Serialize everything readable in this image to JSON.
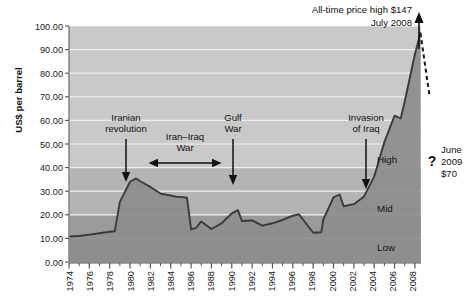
{
  "chart_data": {
    "type": "area",
    "title": "",
    "subtitle": "",
    "xlabel": "",
    "ylabel": "US$ per barrel",
    "xlim": [
      1974,
      2008.6
    ],
    "ylim": [
      0,
      100
    ],
    "grid": true,
    "legend_position": "none",
    "y_ticks": [
      "0.00",
      "10.00",
      "20.00",
      "30.00",
      "40.00",
      "50.00",
      "60.00",
      "70.00",
      "80.00",
      "90.00",
      "100.00"
    ],
    "y_tick_values": [
      0,
      10,
      20,
      30,
      40,
      50,
      60,
      70,
      80,
      90,
      100
    ],
    "x_ticks": [
      "1974",
      "1976",
      "1978",
      "1980",
      "1982",
      "1984",
      "1986",
      "1988",
      "1990",
      "1992",
      "1994",
      "1996",
      "1998",
      "2000",
      "2002",
      "2004",
      "2006",
      "2008"
    ],
    "x_tick_values": [
      1974,
      1976,
      1978,
      1980,
      1982,
      1984,
      1986,
      1988,
      1990,
      1992,
      1994,
      1996,
      1998,
      2000,
      2002,
      2004,
      2006,
      2008
    ],
    "x_minor_ticks": [
      1975,
      1977,
      1979,
      1981,
      1983,
      1985,
      1987,
      1989,
      1991,
      1993,
      1995,
      1997,
      1999,
      2001,
      2003,
      2005,
      2007
    ],
    "series": [
      {
        "name": "Crude oil price",
        "x": [
          1974,
          1975,
          1976,
          1977,
          1978,
          1978.5,
          1979,
          1980,
          1980.6,
          1981,
          1982,
          1983,
          1984,
          1984.6,
          1985,
          1985.6,
          1986,
          1986.5,
          1987,
          1987.5,
          1988,
          1989,
          1990,
          1990.6,
          1991,
          1992,
          1993,
          1994,
          1995,
          1996,
          1996.6,
          1997,
          1998,
          1998.8,
          1999,
          2000,
          2000.6,
          2001,
          2002,
          2003,
          2004,
          2005,
          2006,
          2006.6,
          2007,
          2008,
          2008.55
        ],
        "y": [
          10.8,
          11.0,
          11.6,
          12.2,
          12.8,
          13.0,
          25.5,
          34.0,
          35.4,
          34.2,
          31.8,
          29.0,
          28.2,
          27.6,
          27.6,
          27.2,
          13.8,
          14.5,
          17.2,
          15.6,
          14.0,
          16.4,
          20.6,
          22.0,
          17.4,
          17.6,
          15.4,
          16.4,
          17.8,
          19.6,
          20.2,
          18.0,
          12.4,
          12.6,
          18.0,
          27.4,
          28.6,
          23.6,
          24.5,
          27.8,
          36.2,
          50.8,
          62.0,
          60.8,
          68.0,
          88.0,
          97.0
        ],
        "color": "#3a3a3a",
        "fill": true
      },
      {
        "name": "Projected decline",
        "style": "dashed",
        "x": [
          2008.55,
          2009.45
        ],
        "y": [
          97.0,
          70.0
        ],
        "color": "#1f1f1f"
      }
    ],
    "bands": [
      {
        "label": "Low",
        "from": 0,
        "to": 20,
        "color": "#9a9a9a"
      },
      {
        "label": "Mid",
        "from": 20,
        "to": 40,
        "color": "#b4b4b4"
      },
      {
        "label": "High",
        "from": 40,
        "to": 100,
        "color": "#c9c9c9"
      }
    ],
    "annotations": [
      {
        "id": "iranian-revolution",
        "text_lines": [
          "Iranian",
          "revolution"
        ],
        "marker": "down-arrow",
        "at_x": 1979
      },
      {
        "id": "iran-iraq-war",
        "text_lines": [
          "Iran–Iraq",
          "War"
        ],
        "marker": "double-arrow",
        "from_x": 1980.6,
        "to_x": 1988
      },
      {
        "id": "gulf-war",
        "text_lines": [
          "Gulf",
          "War"
        ],
        "marker": "down-arrow",
        "at_x": 1990.4
      },
      {
        "id": "invasion-of-iraq",
        "text_lines": [
          "Invasion",
          "of Iraq"
        ],
        "marker": "down-arrow",
        "at_x": 2003
      },
      {
        "id": "all-time-high",
        "text_lines": [
          "All-time price high $147",
          "July 2008"
        ],
        "marker": "up-arrow",
        "at_x": 2008.5
      },
      {
        "id": "june-2009",
        "text_lines": [
          "June",
          "2009",
          "$70"
        ],
        "marker": "question",
        "question_mark": "?",
        "at_x": 2009.45
      }
    ]
  },
  "axes": {
    "y_axis_title": "US$ per barrel"
  },
  "annotations_text": {
    "iranian_revolution_l1": "Iranian",
    "iranian_revolution_l2": "revolution",
    "iran_iraq_l1": "Iran–Iraq",
    "iran_iraq_l2": "War",
    "gulf_war_l1": "Gulf",
    "gulf_war_l2": "War",
    "invasion_l1": "Invasion",
    "invasion_l2": "of Iraq",
    "alltime_l1": "All-time price high $147",
    "alltime_l2": "July 2008",
    "june_l1": "June",
    "june_l2": "2009",
    "june_l3": "$70",
    "question_mark": "?"
  },
  "band_labels": {
    "high": "High",
    "mid": "Mid",
    "low": "Low"
  },
  "y_tick_labels": {
    "t0": "0.00",
    "t10": "10.00",
    "t20": "20.00",
    "t30": "30.00",
    "t40": "40.00",
    "t50": "50.00",
    "t60": "60.00",
    "t70": "70.00",
    "t80": "80.00",
    "t90": "90.00",
    "t100": "100.00"
  },
  "x_tick_labels": {
    "y1974": "1974",
    "y1976": "1976",
    "y1978": "1978",
    "y1980": "1980",
    "y1982": "1982",
    "y1984": "1984",
    "y1986": "1986",
    "y1988": "1988",
    "y1990": "1990",
    "y1992": "1992",
    "y1994": "1994",
    "y1996": "1996",
    "y1998": "1998",
    "y2000": "2000",
    "y2002": "2002",
    "y2004": "2004",
    "y2006": "2006",
    "y2008": "2008"
  },
  "colors": {
    "band_low": "#9a9a9a",
    "band_mid": "#b4b4b4",
    "band_high": "#c9c9c9",
    "line": "#3a3a3a",
    "area_fill": "#8f8f8f",
    "axis": "#7a7a7a",
    "gridline": "#ececec",
    "text": "#111111",
    "background": "#ffffff"
  }
}
